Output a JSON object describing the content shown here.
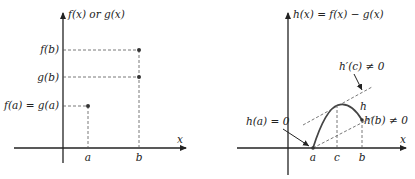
{
  "left_panel": {
    "y_axis_label": "f(x) or g(x)",
    "x_axis_label": "x",
    "x_ticks": [
      "a",
      "b"
    ],
    "y_ticks": [
      "f(b)",
      "g(b)",
      "f(a) = g(a)"
    ],
    "points": [
      {
        "name": "(a, f(a)=g(a))"
      },
      {
        "name": "(b, f(b))"
      },
      {
        "name": "(b, g(b))"
      }
    ]
  },
  "right_panel": {
    "y_axis_label": "h(x) = f(x) − g(x)",
    "x_axis_label": "x",
    "x_ticks": [
      "a",
      "c",
      "b"
    ],
    "curve_label": "h",
    "annotations": [
      "h(a) = 0",
      "h′(c) ≠ 0",
      "h(b) ≠ 0"
    ]
  },
  "colors": {
    "axis": "#222222",
    "dashed": "#555555",
    "curve": "#444444",
    "background": "#ffffff"
  }
}
